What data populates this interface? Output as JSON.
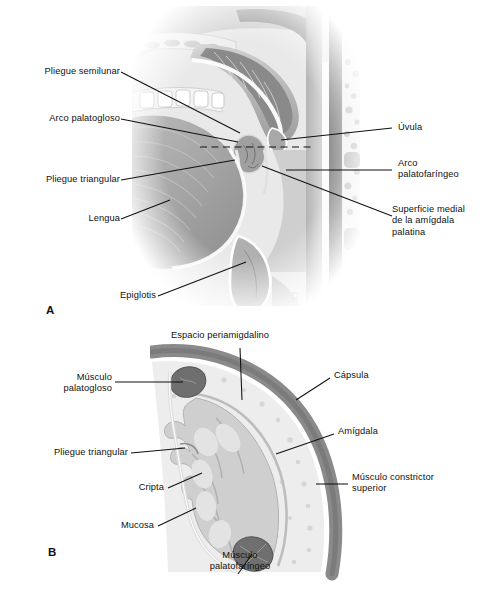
{
  "figure": {
    "language": "es",
    "style": "grayscale anatomical illustration",
    "background_color": "#ffffff",
    "ink_color": "#111111"
  },
  "panel_a": {
    "letter": "A",
    "description": "Corte sagital medio de la orofaringe que muestra la amígdala palatina, el paladar blando, la úvula, la lengua y la epiglotis",
    "labels_left": [
      {
        "id": "pliegue-semilunar",
        "text": "Pliegue semilunar"
      },
      {
        "id": "arco-palatogloso",
        "text": "Arco palatogloso"
      },
      {
        "id": "pliegue-triangular",
        "text": "Pliegue triangular"
      },
      {
        "id": "lengua",
        "text": "Lengua"
      },
      {
        "id": "epiglotis",
        "text": "Epiglotis"
      }
    ],
    "labels_right": [
      {
        "id": "uvula",
        "text": "Úvula"
      },
      {
        "id": "arco-palatofaringeo",
        "text": "Arco\npalatofaríngeo"
      },
      {
        "id": "superficie-medial",
        "text": "Superficie medial\nde la amígdala\npalatina"
      }
    ],
    "section_line": {
      "id": "plano-de-corte",
      "style": "dashed",
      "note": "Línea discontinua que indica el plano del corte mostrado en B"
    }
  },
  "panel_b": {
    "letter": "B",
    "description": "Corte transversal de la amígdala palatina y su lecho amigdalino",
    "labels_top": [
      {
        "id": "espacio-periamigdalino",
        "text": "Espacio periamigdalino"
      }
    ],
    "labels_left": [
      {
        "id": "musculo-palatogloso",
        "text": "Músculo\npalatogloso"
      },
      {
        "id": "pliegue-triangular-b",
        "text": "Pliegue triangular"
      },
      {
        "id": "cripta",
        "text": "Cripta"
      },
      {
        "id": "mucosa",
        "text": "Mucosa"
      }
    ],
    "labels_right": [
      {
        "id": "capsula",
        "text": "Cápsula"
      },
      {
        "id": "amigdala",
        "text": "Amígdala"
      },
      {
        "id": "musculo-constrictor-superior",
        "text": "Músculo constrictor\nsuperior"
      }
    ],
    "labels_bottom": [
      {
        "id": "musculo-palatofaringeo",
        "text": "Músculo\npalatofaríngeo"
      }
    ]
  },
  "palette": {
    "ink": "#111111",
    "outer_muscle": "#8c8c8c",
    "muscle_dark": "#6f6f6f",
    "capsule_light": "#e2e2e2",
    "tonsil_fill": "#cfcfcf",
    "tissue_mid": "#a9a9a9",
    "tissue_pale": "#efefef",
    "highlight": "#ffffff"
  }
}
